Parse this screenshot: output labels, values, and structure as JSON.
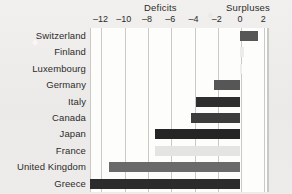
{
  "chart_data": {
    "type": "bar",
    "orientation": "horizontal",
    "title": "",
    "xlabel": "",
    "ylabel": "",
    "xlim": [
      -12.9,
      2.4
    ],
    "grid": true,
    "zero_line": 0,
    "group_labels": {
      "left": "Deficits",
      "right": "Surpluses"
    },
    "tick_labels": [
      "–12",
      "–10",
      "–8",
      "–6",
      "–4",
      "–2",
      "0",
      "2"
    ],
    "tick_values": [
      -12,
      -10,
      -8,
      -6,
      -4,
      -2,
      0,
      2
    ],
    "categories": [
      "Switzerland",
      "Finland",
      "Luxembourg",
      "Germany",
      "Italy",
      "Canada",
      "Japan",
      "France",
      "United Kingdom",
      "Greece"
    ],
    "values": [
      1.5,
      0.3,
      0.2,
      -2.2,
      -3.8,
      -4.2,
      -7.3,
      -7.3,
      -11.3,
      -15.4
    ],
    "bar_colors": [
      "#565656",
      "#ececea",
      "#ededeb",
      "#565656",
      "#2e2e2e",
      "#3c3c3c",
      "#252525",
      "#e4e4e2",
      "#6a6a6a",
      "#2b2b2b"
    ]
  },
  "colors": {
    "background": "#eeecea",
    "plot_background": "#fdfdfc",
    "gridline": "#c9c9c5",
    "text": "#2b2b2b"
  }
}
